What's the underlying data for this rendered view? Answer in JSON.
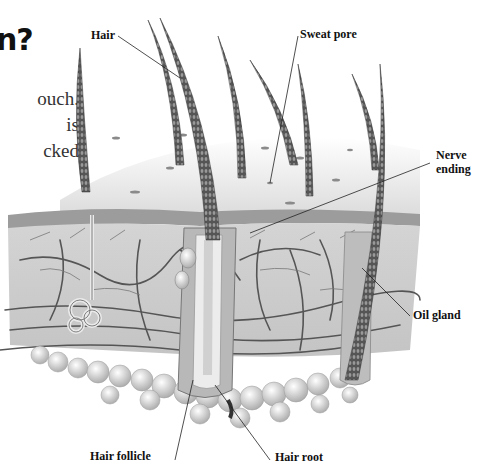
{
  "heading": {
    "text": "n?"
  },
  "body_text": {
    "lines": [
      "ouch.",
      "is",
      "cked"
    ]
  },
  "diagram": {
    "labels": {
      "hair": "Hair",
      "sweat_pore": "Sweat pore",
      "nerve_ending_line1": "Nerve",
      "nerve_ending_line2": "ending",
      "oil_gland": "Oil gland",
      "hair_follicle": "Hair follicle",
      "hair_root": "Hair root"
    }
  }
}
